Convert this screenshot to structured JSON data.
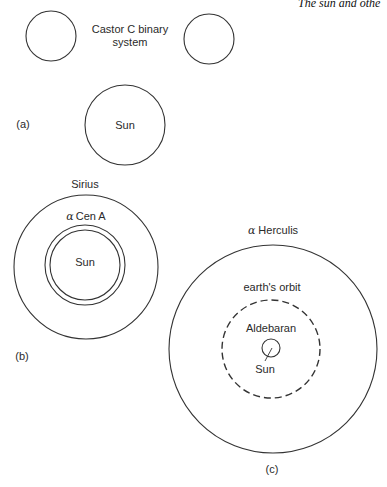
{
  "header": {
    "running_title": "The sun and othe"
  },
  "panel_a": {
    "label": "(a)",
    "castor_caption_line1": "Castor C binary",
    "castor_caption_line2": "system",
    "sun_label": "Sun"
  },
  "panel_b": {
    "label": "(b)",
    "sirius_label": "Sirius",
    "alpha_cen_greek": "α",
    "alpha_cen_name": "Cen A",
    "sun_label": "Sun"
  },
  "panel_c": {
    "label": "(c)",
    "herculis_greek": "α",
    "herculis_name": "Herculis",
    "orbit_label": "earth's orbit",
    "aldebaran_label": "Aldebaran",
    "sun_label": "Sun"
  },
  "colors": {
    "stroke": "#333333",
    "text": "#2a2a2a",
    "background": "#ffffff"
  }
}
